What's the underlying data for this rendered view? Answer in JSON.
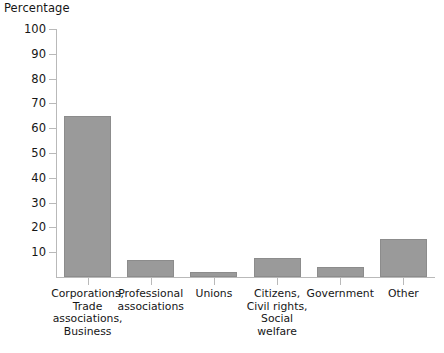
{
  "chart_data": {
    "type": "bar",
    "title": "Percentage",
    "xlabel": "",
    "ylabel": "Percentage",
    "ylim": [
      0,
      100
    ],
    "ytick_values": [
      100,
      90,
      80,
      70,
      60,
      50,
      40,
      30,
      20,
      10
    ],
    "ytick_labels": [
      "100",
      "90",
      "80",
      "70",
      "60",
      "50",
      "40",
      "30",
      "20",
      "10"
    ],
    "grid": false,
    "legend": null,
    "bar_color": "#9a9a9a",
    "axis_color": "#b9b9b9",
    "categories": [
      "Corporations, Trade associations, Business",
      "Professional associations",
      "Unions",
      "Citizens, Civil rights, Social welfare",
      "Government",
      "Other"
    ],
    "category_lines": [
      [
        "Corporations,",
        "Trade",
        "associations,",
        "Business"
      ],
      [
        "Professional",
        "associations"
      ],
      [
        "Unions"
      ],
      [
        "Citizens,",
        "Civil rights,",
        "Social welfare"
      ],
      [
        "Government"
      ],
      [
        "Other"
      ]
    ],
    "values": [
      65,
      7,
      2,
      7.5,
      4,
      15.5
    ]
  },
  "footer": {
    "clipped_caption": ""
  }
}
